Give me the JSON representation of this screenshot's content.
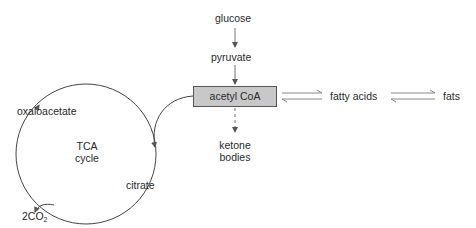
{
  "nodes": {
    "glucose": "glucose",
    "pyruvate": "pyruvate",
    "acetyl_coa": "acetyl CoA",
    "fatty_acids": "fatty acids",
    "fats": "fats",
    "ketone_line1": "ketone",
    "ketone_line2": "bodies",
    "oxaloacetate": "oxaloacetate",
    "tca_line1": "TCA",
    "tca_line2": "cycle",
    "citrate": "citrate",
    "co2_prefix": "2CO",
    "co2_sub": "2"
  },
  "colors": {
    "box_fill": "#c8c8c8",
    "line": "#555555"
  }
}
